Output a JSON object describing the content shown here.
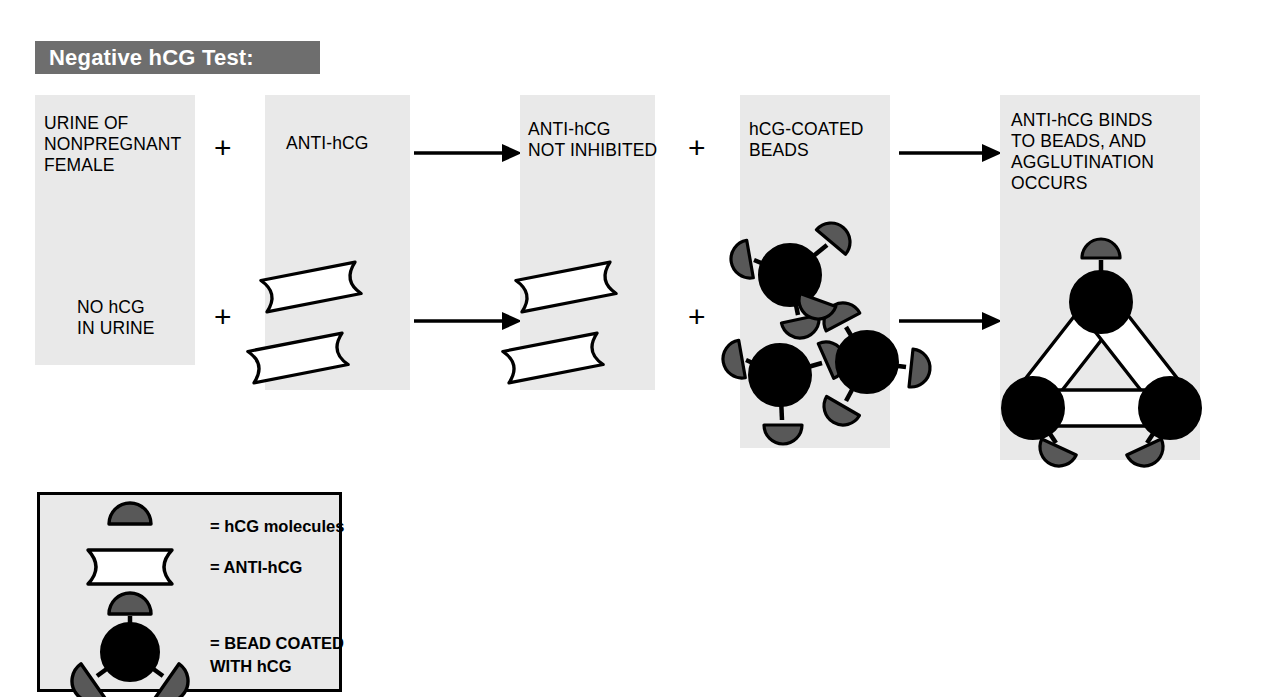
{
  "header": {
    "title": "Negative hCG Test:",
    "bar_color": "#6e6e6e",
    "text_color": "#ffffff"
  },
  "colors": {
    "panel_background": "#e9e9e9",
    "page_background": "#ffffff",
    "bead_fill": "#000000",
    "hcg_molecule_fill": "#585858",
    "antibody_fill": "#ffffff",
    "outline": "#000000"
  },
  "flow": {
    "panels": [
      {
        "id": "panel-urine",
        "lines": [
          "URINE OF",
          "NONPREGNANT",
          "FEMALE"
        ],
        "secondary_lines": [
          "NO hCG",
          "IN URINE"
        ],
        "contents": "none"
      },
      {
        "id": "panel-anti-hcg",
        "lines": [
          "ANTI-hCG"
        ],
        "contents": "two free antibody molecules"
      },
      {
        "id": "panel-not-inhibited",
        "lines": [
          "ANTI-hCG",
          "NOT INHIBITED"
        ],
        "contents": "two free antibody molecules"
      },
      {
        "id": "panel-coated-beads",
        "lines": [
          "hCG-COATED",
          "BEADS"
        ],
        "contents": "three hCG-coated beads"
      },
      {
        "id": "panel-agglutination",
        "lines": [
          "ANTI-hCG BINDS",
          "TO BEADS, AND",
          "AGGLUTINATION",
          "OCCURS"
        ],
        "contents": "three beads cross-linked by antibodies in a triangle"
      }
    ],
    "operators": [
      {
        "id": "plus-1-top",
        "symbol": "+"
      },
      {
        "id": "plus-1-bottom",
        "symbol": "+"
      },
      {
        "id": "plus-2-top",
        "symbol": "+"
      },
      {
        "id": "plus-2-bottom",
        "symbol": "+"
      }
    ],
    "arrows": [
      {
        "id": "arrow-2-to-3-top",
        "direction": "right"
      },
      {
        "id": "arrow-2-to-3-bottom",
        "direction": "right"
      },
      {
        "id": "arrow-4-to-5-top",
        "direction": "right"
      },
      {
        "id": "arrow-4-to-5-bottom",
        "direction": "right"
      }
    ]
  },
  "legend": {
    "entries": [
      {
        "id": "legend-hcg",
        "symbol": "hcg-molecule-glyph",
        "label": "= hCG molecules"
      },
      {
        "id": "legend-anti-hcg",
        "symbol": "anti-hcg-glyph",
        "label": "= ANTI-hCG"
      },
      {
        "id": "legend-bead",
        "symbol": "coated-bead-glyph",
        "label": "= BEAD COATED",
        "label2": "WITH hCG"
      }
    ]
  }
}
